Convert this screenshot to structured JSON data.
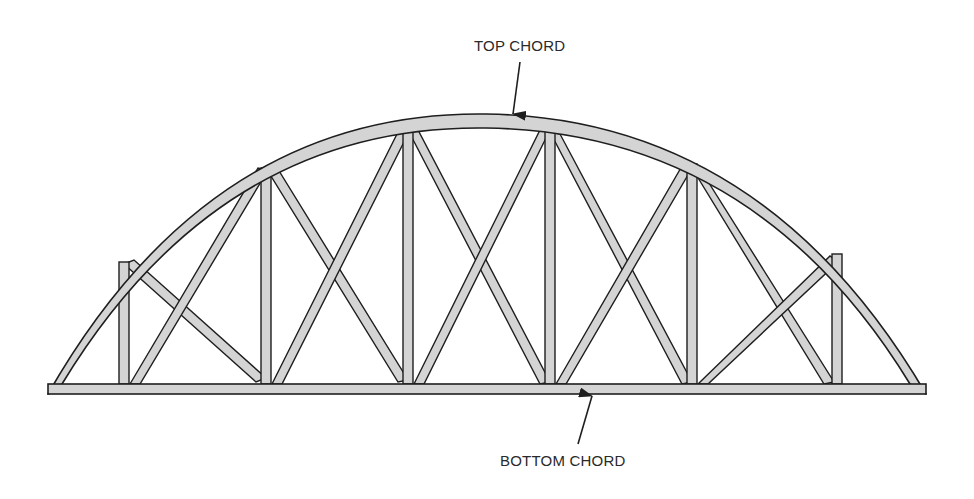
{
  "diagram": {
    "type": "bowstring-truss",
    "labels": {
      "top_chord": "TOP CHORD",
      "bottom_chord": "BOTTOM CHORD"
    },
    "colors": {
      "member_fill": "#d4d4d4",
      "outline": "#1e1e1e",
      "background": "#ffffff",
      "label_text": "#2a2a2a"
    },
    "members": {
      "top_chord": "arched",
      "bottom_chord": "straight",
      "vertical_posts": 6,
      "diagonal_braces": 10
    }
  }
}
